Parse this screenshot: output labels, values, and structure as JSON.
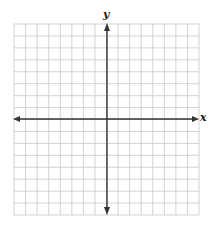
{
  "chart_data": {
    "type": "coordinate-grid",
    "title": "",
    "xlabel": "x",
    "ylabel": "y",
    "grid": true,
    "columns": 16,
    "rows": 16,
    "xlim": [
      -8,
      8
    ],
    "ylim": [
      -8,
      8
    ],
    "axes_arrows": true,
    "tick_labels": [],
    "series": []
  },
  "labels": {
    "x_axis": "x",
    "y_axis": "y"
  },
  "colors": {
    "grid": "#c8c8c8",
    "axis": "#333333",
    "background": "#ffffff"
  }
}
